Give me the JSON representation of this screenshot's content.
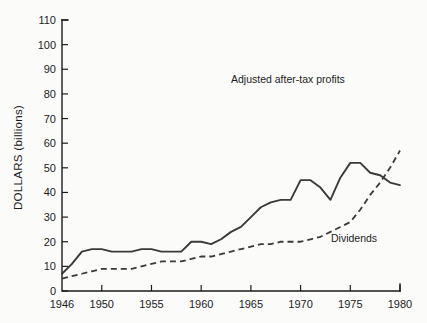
{
  "chart_data": {
    "type": "line",
    "title": "",
    "xlabel": "",
    "ylabel": "DOLLARS (billions)",
    "xlim": [
      1946,
      1980
    ],
    "ylim": [
      0,
      110
    ],
    "grid": false,
    "legend_position": "inline-annotation",
    "x_ticks": [
      "1946",
      "1950",
      "1955",
      "1960",
      "1965",
      "1970",
      "1975",
      "1980"
    ],
    "x_tick_values": [
      1946,
      1950,
      1955,
      1960,
      1965,
      1970,
      1975,
      1980
    ],
    "y_ticks": [
      "0",
      "10",
      "20",
      "30",
      "40",
      "50",
      "60",
      "70",
      "80",
      "90",
      "100",
      "110"
    ],
    "y_tick_values": [
      0,
      10,
      20,
      30,
      40,
      50,
      60,
      70,
      80,
      90,
      100,
      110
    ],
    "x": [
      1946,
      1947,
      1948,
      1949,
      1950,
      1951,
      1952,
      1953,
      1954,
      1955,
      1956,
      1957,
      1958,
      1959,
      1960,
      1961,
      1962,
      1963,
      1964,
      1965,
      1966,
      1967,
      1968,
      1969,
      1970,
      1971,
      1972,
      1973,
      1974,
      1975,
      1976,
      1977,
      1978,
      1979,
      1980
    ],
    "series": [
      {
        "name": "Adjusted after-tax profits",
        "style": "solid",
        "color": "#3a3a3a",
        "label": "Adjusted after-tax profits",
        "values": [
          7,
          11,
          16,
          17,
          17,
          16,
          16,
          16,
          17,
          17,
          16,
          16,
          16,
          20,
          20,
          19,
          21,
          24,
          26,
          30,
          34,
          36,
          37,
          37,
          45,
          45,
          42,
          37,
          46,
          52,
          52,
          48,
          47,
          44,
          43
        ]
      },
      {
        "name": "Dividends",
        "style": "dashed",
        "color": "#3a3a3a",
        "label": "Dividends",
        "values": [
          5,
          6,
          7,
          8,
          9,
          9,
          9,
          9,
          10,
          11,
          12,
          12,
          12,
          13,
          14,
          14,
          15,
          16,
          17,
          18,
          19,
          19,
          20,
          20,
          20,
          21,
          22,
          24,
          26,
          28,
          33,
          39,
          44,
          50,
          57
        ]
      }
    ],
    "annotations": [
      {
        "text": "Adjusted after-tax profits",
        "x": 1970,
        "y": 85
      },
      {
        "text": "Dividends",
        "x": 1974,
        "y": 25
      }
    ]
  },
  "axis": {
    "y_title": "DOLLARS (billions)"
  },
  "labels": {
    "profits": "Adjusted after-tax profits",
    "dividends": "Dividends"
  },
  "colors": {
    "line": "#3a3a3a",
    "axis": "#1c1c1c",
    "background": "#fbfbfa"
  }
}
